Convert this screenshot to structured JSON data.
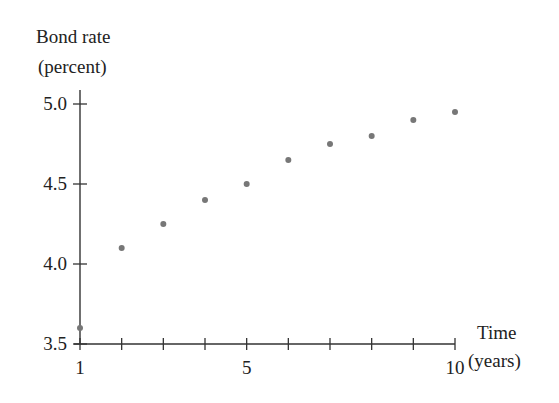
{
  "chart_data": {
    "type": "scatter",
    "title": "",
    "ylabel_line1": "Bond rate",
    "ylabel_line2": "(percent)",
    "xlabel_line1": "Time",
    "xlabel_line2": "(years)",
    "x": [
      1,
      2,
      3,
      4,
      5,
      6,
      7,
      8,
      9,
      10
    ],
    "values": [
      3.6,
      4.1,
      4.25,
      4.4,
      4.5,
      4.65,
      4.75,
      4.8,
      4.9,
      4.95
    ],
    "xlim": [
      1,
      10
    ],
    "ylim": [
      3.5,
      5.0
    ],
    "x_ticks": [
      1,
      2,
      3,
      4,
      5,
      6,
      7,
      8,
      9,
      10
    ],
    "x_tick_labels": [
      {
        "value": 1,
        "label": "1"
      },
      {
        "value": 5,
        "label": "5"
      },
      {
        "value": 10,
        "label": "10"
      }
    ],
    "y_ticks": [
      3.5,
      4.0,
      4.5,
      5.0
    ],
    "y_tick_labels": [
      "3.5",
      "4.0",
      "4.5",
      "5.0"
    ],
    "grid": false,
    "legend": null,
    "marker_color": "#777777",
    "axis_color": "#333333"
  }
}
